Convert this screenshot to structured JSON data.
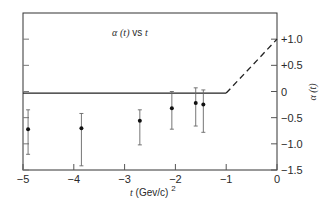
{
  "chart_data": {
    "type": "scatter",
    "title": "α (t) vs t",
    "xlabel": "t (Gev/c)²",
    "ylabel": "α (t)",
    "xlim": [
      -5,
      0
    ],
    "ylim": [
      -1.5,
      1.5
    ],
    "x_ticks": [
      "−5",
      "−4",
      "−3",
      "−2",
      "−1",
      "0"
    ],
    "x_tick_values": [
      -5,
      -4,
      -3,
      -2,
      -1,
      0
    ],
    "y_ticks": [
      "+1.0",
      "+0.5",
      "0",
      "−0.5",
      "−1.0",
      "−1.5"
    ],
    "y_tick_values": [
      1.0,
      0.5,
      0,
      -0.5,
      -1.0,
      -1.5
    ],
    "y_axis_position": "right",
    "grid": false,
    "series": [
      {
        "name": "measured α(t)",
        "style": "points-with-error-bars",
        "x": [
          -4.9,
          -3.85,
          -2.7,
          -2.07,
          -1.6,
          -1.45
        ],
        "y": [
          -0.72,
          -0.7,
          -0.56,
          -0.32,
          -0.22,
          -0.25
        ],
        "y_err_high": [
          -0.35,
          -0.42,
          -0.35,
          0.0,
          0.07,
          0.03
        ],
        "y_err_low": [
          -1.2,
          -1.42,
          -1.02,
          -0.72,
          -0.66,
          -0.78
        ]
      },
      {
        "name": "trajectory (solid)",
        "style": "solid-line",
        "x": [
          -5,
          -1
        ],
        "y": [
          -0.03,
          -0.03
        ]
      },
      {
        "name": "trajectory (extrapolated)",
        "style": "dashed-line",
        "x": [
          -1,
          0
        ],
        "y": [
          -0.03,
          1.0
        ]
      }
    ]
  },
  "labels": {
    "title_alpha": "α",
    "title_t1": "(t)",
    "title_vs": "vs",
    "title_t2": "t",
    "xlabel_t": "t",
    "xlabel_unit": "(Gev/c)",
    "xlabel_sup": "2",
    "ylabel": "α (t)"
  }
}
